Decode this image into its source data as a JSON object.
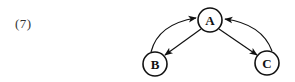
{
  "figure": {
    "label": "(7)"
  },
  "diagram": {
    "type": "directed-graph",
    "nodes": [
      {
        "id": "A",
        "label": "A",
        "cx": 210,
        "cy": 20,
        "r": 12
      },
      {
        "id": "B",
        "label": "B",
        "cx": 155,
        "cy": 64,
        "r": 12
      },
      {
        "id": "C",
        "label": "C",
        "cx": 267,
        "cy": 63,
        "r": 12
      }
    ],
    "edges": [
      {
        "from": "B",
        "to": "A",
        "style": "curved"
      },
      {
        "from": "A",
        "to": "B",
        "style": "straight"
      },
      {
        "from": "C",
        "to": "A",
        "style": "curved"
      },
      {
        "from": "A",
        "to": "C",
        "style": "straight"
      }
    ],
    "colors": {
      "stroke": "#111111",
      "fill": "#ffffff",
      "label": "#333333"
    }
  }
}
